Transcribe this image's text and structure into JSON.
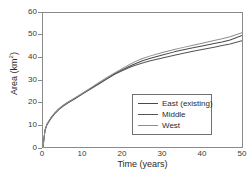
{
  "chart_data": {
    "type": "line",
    "title": "",
    "xlabel": "Time (years)",
    "ylabel": "Area (km2)",
    "ylabel_base": "Area (km",
    "ylabel_sup": "2",
    "ylabel_close": ")",
    "xlim": [
      0,
      50
    ],
    "ylim": [
      0,
      60
    ],
    "xticks": [
      0,
      10,
      20,
      30,
      40,
      50
    ],
    "yticks": [
      0,
      10,
      20,
      30,
      40,
      50,
      60
    ],
    "grid": false,
    "legend_position": "center-right",
    "x": [
      0,
      0.5,
      1,
      2,
      3,
      4,
      5,
      6,
      8,
      10,
      12,
      14,
      16,
      18,
      20,
      22,
      23,
      25,
      27,
      30,
      33,
      35,
      38,
      40,
      43,
      45,
      47,
      50
    ],
    "series": [
      {
        "name": "East (existing)",
        "color": "#4a4a4a",
        "values": [
          0,
          7.5,
          10.2,
          13.0,
          15.2,
          17.0,
          18.4,
          19.6,
          21.8,
          24.0,
          26.2,
          28.4,
          30.6,
          32.8,
          34.6,
          36.4,
          37.2,
          38.6,
          39.7,
          41.2,
          42.6,
          43.4,
          44.5,
          45.2,
          46.3,
          47.0,
          47.9,
          49.9
        ]
      },
      {
        "name": "Middle",
        "color": "#555555",
        "values": [
          0,
          7.4,
          10.0,
          12.8,
          15.0,
          16.8,
          18.2,
          19.4,
          21.6,
          23.8,
          26.0,
          28.2,
          30.4,
          32.5,
          34.2,
          35.8,
          36.5,
          37.6,
          38.6,
          39.9,
          41.1,
          41.9,
          43.0,
          43.7,
          44.7,
          45.4,
          46.1,
          47.6
        ]
      },
      {
        "name": "West",
        "color": "#8e8e8e",
        "values": [
          0,
          7.6,
          10.3,
          13.2,
          15.4,
          17.2,
          18.6,
          19.8,
          22.0,
          24.2,
          26.5,
          28.8,
          31.0,
          33.2,
          35.2,
          37.2,
          38.1,
          39.6,
          40.8,
          42.3,
          43.7,
          44.5,
          45.7,
          46.5,
          47.7,
          48.5,
          49.4,
          51.2
        ]
      }
    ]
  },
  "axes": {
    "x_tick_labels": [
      "0",
      "10",
      "20",
      "30",
      "40",
      "50"
    ],
    "y_tick_labels": [
      "0",
      "10",
      "20",
      "30",
      "40",
      "50",
      "60"
    ]
  }
}
